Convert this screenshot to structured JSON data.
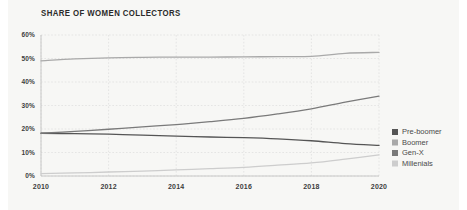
{
  "chart_data": {
    "type": "line",
    "title": "SHARE OF WOMEN COLLECTORS",
    "xlabel": "",
    "ylabel": "",
    "x": [
      2010,
      2011,
      2012,
      2013,
      2014,
      2015,
      2016,
      2017,
      2018,
      2019,
      2020
    ],
    "xlim": [
      2010,
      2020
    ],
    "ylim": [
      0,
      60
    ],
    "xticks": [
      2010,
      2012,
      2014,
      2016,
      2018,
      2020
    ],
    "xtick_labels": [
      "2010",
      "2012",
      "2014",
      "2016",
      "2018",
      "2020"
    ],
    "yticks": [
      0,
      10,
      20,
      30,
      40,
      50,
      60
    ],
    "ytick_labels": [
      "0%",
      "10%",
      "20%",
      "30%",
      "40%",
      "50%",
      "60%"
    ],
    "grid": true,
    "grid_style": "dotted",
    "legend_position": "right",
    "series": [
      {
        "name": "Pre-boomer",
        "color": "#555555",
        "values": [
          18.2,
          18.0,
          17.8,
          17.4,
          17.0,
          16.6,
          16.3,
          15.8,
          15.0,
          13.8,
          13.0
        ]
      },
      {
        "name": "Boomer",
        "color": "#a9a9a9",
        "values": [
          49.0,
          49.8,
          50.3,
          50.5,
          50.6,
          50.6,
          50.7,
          50.8,
          50.9,
          52.2,
          52.6
        ]
      },
      {
        "name": "Gen-X",
        "color": "#7a7a7a",
        "values": [
          18.2,
          19.0,
          19.9,
          20.9,
          21.9,
          23.1,
          24.5,
          26.4,
          28.6,
          31.4,
          34.0
        ]
      },
      {
        "name": "Millenials",
        "color": "#cdcdcd",
        "values": [
          1.0,
          1.3,
          1.7,
          2.1,
          2.6,
          3.1,
          3.7,
          4.6,
          5.6,
          7.2,
          9.0
        ]
      }
    ]
  },
  "style": {
    "page_background": "#ffffff",
    "card_background": "#f7f7f5",
    "grid_color": "#dddddd",
    "axis_color": "#bdbdbd",
    "title_color": "#2b2b2b",
    "tick_color": "#3d3d3d",
    "legend_text_color": "#4a4a4a"
  }
}
